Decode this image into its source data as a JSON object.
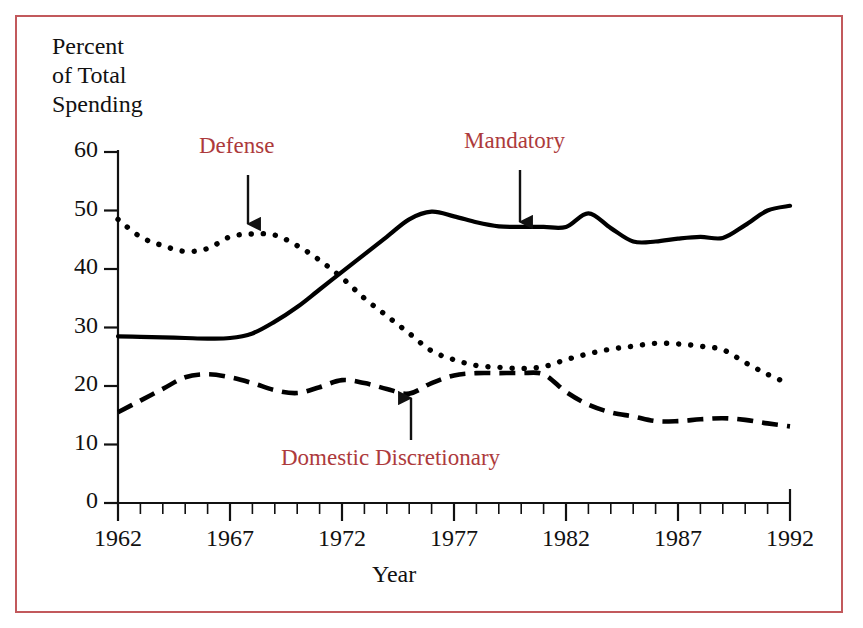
{
  "figure": {
    "border_color": "#c2595c",
    "label_color": "#ad3a3c",
    "line_color": "#000000"
  },
  "axes": {
    "y_title": "Percent\nof Total\nSpending",
    "x_title": "Year",
    "y_ticks": [
      "60",
      "50",
      "40",
      "30",
      "20",
      "10",
      "0"
    ],
    "x_ticks": [
      "1962",
      "1967",
      "1972",
      "1977",
      "1982",
      "1987",
      "1992"
    ]
  },
  "annotations": [
    {
      "name": "defense",
      "label": "Defense",
      "arrow": "down"
    },
    {
      "name": "mandatory",
      "label": "Mandatory",
      "arrow": "down"
    },
    {
      "name": "domestic-discretionary",
      "label": "Domestic Discretionary",
      "arrow": "up"
    }
  ],
  "chart_data": {
    "type": "line",
    "title": "",
    "xlabel": "Year",
    "ylabel": "Percent of Total Spending",
    "xlim": [
      1962,
      1992
    ],
    "ylim": [
      0,
      60
    ],
    "yticks": [
      0,
      10,
      20,
      30,
      40,
      50,
      60
    ],
    "xticks": [
      1962,
      1967,
      1972,
      1977,
      1982,
      1987,
      1992
    ],
    "xminor_tick_interval": 1,
    "grid": false,
    "legend": "annotated-arrows",
    "x": [
      1962,
      1963,
      1964,
      1965,
      1966,
      1967,
      1968,
      1969,
      1970,
      1971,
      1972,
      1973,
      1974,
      1975,
      1976,
      1977,
      1978,
      1979,
      1980,
      1981,
      1982,
      1983,
      1984,
      1985,
      1986,
      1987,
      1988,
      1989,
      1990,
      1991,
      1992
    ],
    "series": [
      {
        "name": "Defense",
        "style": "dotted",
        "values": [
          48.5,
          45.5,
          44.0,
          43.0,
          43.5,
          45.5,
          46.0,
          45.8,
          44.0,
          41.5,
          38.5,
          35.0,
          32.0,
          29.0,
          26.0,
          24.5,
          23.5,
          23.2,
          23.0,
          23.3,
          24.5,
          25.5,
          26.3,
          26.8,
          27.3,
          27.2,
          26.8,
          26.2,
          24.0,
          22.0,
          20.3
        ]
      },
      {
        "name": "Mandatory",
        "style": "solid",
        "values": [
          28.5,
          28.4,
          28.3,
          28.2,
          28.1,
          28.2,
          29.0,
          31.0,
          33.5,
          36.5,
          39.5,
          42.5,
          45.5,
          48.5,
          49.8,
          49.0,
          48.0,
          47.3,
          47.2,
          47.2,
          47.2,
          49.5,
          47.0,
          44.7,
          44.7,
          45.2,
          45.5,
          45.3,
          47.5,
          50.0,
          50.8
        ]
      },
      {
        "name": "Domestic Discretionary",
        "style": "dashed",
        "values": [
          15.5,
          17.5,
          19.5,
          21.5,
          22.0,
          21.5,
          20.5,
          19.3,
          18.8,
          19.8,
          21.0,
          20.5,
          19.5,
          18.7,
          20.5,
          21.8,
          22.2,
          22.2,
          22.2,
          22.0,
          19.0,
          16.8,
          15.5,
          14.8,
          14.0,
          14.0,
          14.3,
          14.5,
          14.2,
          13.6,
          13.1
        ]
      }
    ]
  }
}
